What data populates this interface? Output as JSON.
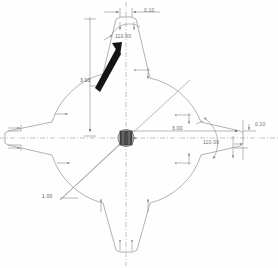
{
  "drawing": {
    "title": "Cross-Section Profile Sketch",
    "background_color": "#fefefe",
    "geometry_color": "#9a9a9a",
    "centerline_color": "#b0a8a8",
    "dimension_color": "#6d6d6d",
    "cursor_color": "#111111",
    "hub_color": "#3a3a3a"
  },
  "dimensions": {
    "top_width": "0.10",
    "top_angle": "110.00",
    "vertical_height": "3.00",
    "horizontal_radius": "3.00",
    "right_tip_width": "0.10",
    "right_angle": "110.00",
    "right_gap": "0.10",
    "lower_left_radius": "1.00"
  },
  "icons": {
    "cursor": "cursor-arrow-icon",
    "hatch_up": "hatch-arrow-up-icon",
    "hatch_down": "hatch-arrow-down-icon",
    "hatch_right": "hatch-arrow-right-icon",
    "origin": "origin-hub-icon"
  }
}
